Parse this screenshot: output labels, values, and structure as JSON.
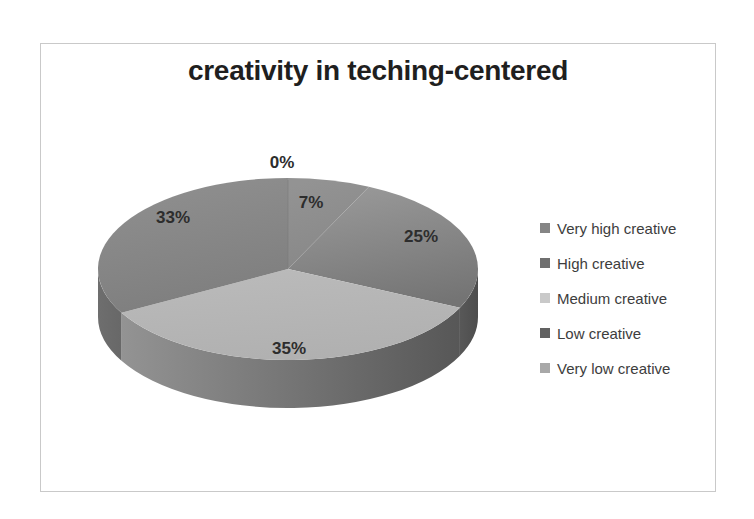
{
  "chart_data": {
    "type": "pie",
    "style": "3d",
    "title": "creativity in teching-centered",
    "unit": "%",
    "total": 100,
    "grayscale": true,
    "legend_position": "right",
    "categories": [
      "Very high creative",
      "High creative",
      "Medium creative",
      "Low creative",
      "Very low creative"
    ],
    "values": [
      0,
      7,
      25,
      35,
      33
    ],
    "slices": [
      {
        "name": "Very high creative",
        "value": 0,
        "pct_label": "0%",
        "top": [
          "#8d8d8d",
          "#8d8d8d"
        ],
        "side": null,
        "legend": "#858585"
      },
      {
        "name": "High creative",
        "value": 7,
        "pct_label": "7%",
        "top": [
          "#939393",
          "#878787"
        ],
        "side": null,
        "legend": "#6f6f6f"
      },
      {
        "name": "Medium creative",
        "value": 25,
        "pct_label": "25%",
        "top": [
          "#989898",
          "#747474"
        ],
        "side": [
          "#585858",
          "#4d4d4d"
        ],
        "legend": "#c9c9c9"
      },
      {
        "name": "Low creative",
        "value": 35,
        "pct_label": "35%",
        "top": [
          "#bababa",
          "#b0b0b0"
        ],
        "side": [
          "#939393",
          "#575757"
        ],
        "legend": "#616161"
      },
      {
        "name": "Very low creative",
        "value": 33,
        "pct_label": "33%",
        "top": [
          "#8f8f8f",
          "#7d7d7d"
        ],
        "side": [
          "#6e6e6e",
          "#686868"
        ],
        "legend": "#a8a8a8"
      }
    ]
  },
  "frame": {
    "border_color": "#c9c9c9",
    "background": "#ffffff"
  }
}
